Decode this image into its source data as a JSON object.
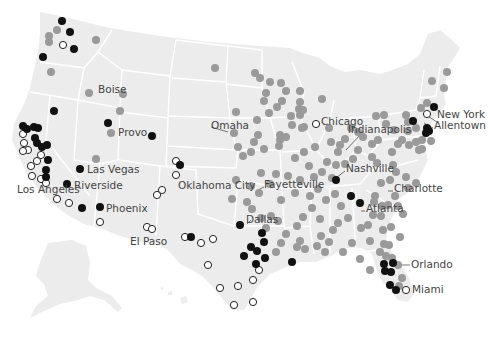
{
  "map": {
    "region": "United States (contiguous, with Alaska inset)",
    "legend_colors": {
      "gray": "#9a9a9a",
      "black": "#111111",
      "open": "#ffffff"
    }
  },
  "city_labels": [
    {
      "name": "Boise",
      "x": 98,
      "y": 93,
      "anchor": "start"
    },
    {
      "name": "Provo",
      "x": 118,
      "y": 136,
      "anchor": "start"
    },
    {
      "name": "Las Vegas",
      "x": 87,
      "y": 173,
      "anchor": "start"
    },
    {
      "name": "Riverside",
      "x": 74,
      "y": 189,
      "anchor": "start"
    },
    {
      "name": "Los Angeles",
      "x": 17,
      "y": 193,
      "anchor": "start"
    },
    {
      "name": "Phoenix",
      "x": 106,
      "y": 212,
      "anchor": "start"
    },
    {
      "name": "El Paso",
      "x": 130,
      "y": 245,
      "anchor": "start"
    },
    {
      "name": "Oklahoma City",
      "x": 178,
      "y": 189,
      "anchor": "start"
    },
    {
      "name": "Dallas",
      "x": 246,
      "y": 223,
      "anchor": "start"
    },
    {
      "name": "Omaha",
      "x": 211,
      "y": 129,
      "anchor": "start"
    },
    {
      "name": "Chicago",
      "x": 321,
      "y": 125,
      "anchor": "start"
    },
    {
      "name": "Indianapolis",
      "x": 348,
      "y": 133,
      "anchor": "start"
    },
    {
      "name": "Fayetteville",
      "x": 264,
      "y": 188,
      "anchor": "start"
    },
    {
      "name": "Nashville",
      "x": 346,
      "y": 172,
      "anchor": "start"
    },
    {
      "name": "Charlotte",
      "x": 394,
      "y": 192,
      "anchor": "start"
    },
    {
      "name": "Atlanta",
      "x": 366,
      "y": 212,
      "anchor": "start"
    },
    {
      "name": "New York",
      "x": 437,
      "y": 118,
      "anchor": "start"
    },
    {
      "name": "Allentown",
      "x": 434,
      "y": 129,
      "anchor": "start"
    },
    {
      "name": "Orlando",
      "x": 411,
      "y": 268,
      "anchor": "start"
    },
    {
      "name": "Miami",
      "x": 412,
      "y": 293,
      "anchor": "start"
    }
  ],
  "dots": {
    "black": [
      [
        62,
        21
      ],
      [
        70,
        32
      ],
      [
        74,
        49
      ],
      [
        43,
        57
      ],
      [
        54,
        111
      ],
      [
        23,
        126
      ],
      [
        27,
        129
      ],
      [
        34,
        127
      ],
      [
        38,
        128
      ],
      [
        35,
        138
      ],
      [
        37,
        143
      ],
      [
        42,
        147
      ],
      [
        47,
        145
      ],
      [
        48,
        160
      ],
      [
        46,
        170
      ],
      [
        80,
        169
      ],
      [
        67,
        184
      ],
      [
        46,
        177
      ],
      [
        82,
        208
      ],
      [
        100,
        207
      ],
      [
        108,
        123
      ],
      [
        152,
        136
      ],
      [
        180,
        165
      ],
      [
        191,
        237
      ],
      [
        240,
        225
      ],
      [
        262,
        233
      ],
      [
        257,
        251
      ],
      [
        264,
        242
      ],
      [
        251,
        247
      ],
      [
        265,
        258
      ],
      [
        244,
        256
      ],
      [
        256,
        264
      ],
      [
        292,
        262
      ],
      [
        351,
        196
      ],
      [
        360,
        203
      ],
      [
        434,
        107
      ],
      [
        413,
        121
      ],
      [
        427,
        128
      ],
      [
        429,
        131
      ],
      [
        426,
        133
      ],
      [
        384,
        264
      ],
      [
        393,
        263
      ],
      [
        385,
        271
      ],
      [
        391,
        272
      ],
      [
        390,
        285
      ],
      [
        396,
        290
      ],
      [
        336,
        180
      ]
    ],
    "open": [
      [
        63,
        45
      ],
      [
        23,
        134
      ],
      [
        24,
        143
      ],
      [
        28,
        150
      ],
      [
        23,
        151
      ],
      [
        37,
        161
      ],
      [
        41,
        155
      ],
      [
        31,
        166
      ],
      [
        32,
        176
      ],
      [
        41,
        179
      ],
      [
        46,
        183
      ],
      [
        57,
        199
      ],
      [
        69,
        203
      ],
      [
        100,
        222
      ],
      [
        147,
        227
      ],
      [
        152,
        229
      ],
      [
        162,
        190
      ],
      [
        157,
        195
      ],
      [
        176,
        175
      ],
      [
        176,
        161
      ],
      [
        185,
        237
      ],
      [
        201,
        243
      ],
      [
        213,
        239
      ],
      [
        208,
        265
      ],
      [
        238,
        286
      ],
      [
        220,
        288
      ],
      [
        234,
        305
      ],
      [
        259,
        270
      ],
      [
        253,
        280
      ],
      [
        253,
        302
      ],
      [
        316,
        124
      ],
      [
        427,
        114
      ],
      [
        406,
        290
      ]
    ],
    "gray": [
      [
        49,
        36
      ],
      [
        57,
        30
      ],
      [
        49,
        42
      ],
      [
        51,
        72
      ],
      [
        96,
        40
      ],
      [
        89,
        93
      ],
      [
        123,
        94
      ],
      [
        120,
        111
      ],
      [
        111,
        133
      ],
      [
        96,
        159
      ],
      [
        215,
        68
      ],
      [
        266,
        93
      ],
      [
        281,
        83
      ],
      [
        286,
        91
      ],
      [
        300,
        91
      ],
      [
        300,
        102
      ],
      [
        299,
        109
      ],
      [
        303,
        110
      ],
      [
        304,
        127
      ],
      [
        282,
        101
      ],
      [
        277,
        107
      ],
      [
        300,
        115
      ],
      [
        322,
        99
      ],
      [
        302,
        128
      ],
      [
        269,
        113
      ],
      [
        291,
        116
      ],
      [
        292,
        125
      ],
      [
        280,
        135
      ],
      [
        280,
        140
      ],
      [
        286,
        137
      ],
      [
        279,
        146
      ],
      [
        264,
        149
      ],
      [
        295,
        158
      ],
      [
        261,
        173
      ],
      [
        276,
        174
      ],
      [
        288,
        176
      ],
      [
        270,
        184
      ],
      [
        304,
        152
      ],
      [
        315,
        147
      ],
      [
        329,
        128
      ],
      [
        331,
        142
      ],
      [
        338,
        152
      ],
      [
        309,
        166
      ],
      [
        314,
        177
      ],
      [
        318,
        189
      ],
      [
        310,
        196
      ],
      [
        312,
        208
      ],
      [
        320,
        219
      ],
      [
        341,
        206
      ],
      [
        338,
        223
      ],
      [
        333,
        230
      ],
      [
        329,
        242
      ],
      [
        325,
        252
      ],
      [
        343,
        252
      ],
      [
        352,
        243
      ],
      [
        361,
        228
      ],
      [
        348,
        218
      ],
      [
        368,
        225
      ],
      [
        370,
        241
      ],
      [
        360,
        259
      ],
      [
        370,
        270
      ],
      [
        380,
        252
      ],
      [
        384,
        244
      ],
      [
        383,
        230
      ],
      [
        373,
        215
      ],
      [
        388,
        205
      ],
      [
        395,
        196
      ],
      [
        408,
        188
      ],
      [
        416,
        183
      ],
      [
        406,
        177
      ],
      [
        396,
        172
      ],
      [
        393,
        165
      ],
      [
        392,
        152
      ],
      [
        398,
        144
      ],
      [
        402,
        140
      ],
      [
        409,
        145
      ],
      [
        416,
        142
      ],
      [
        419,
        150
      ],
      [
        422,
        140
      ],
      [
        416,
        128
      ],
      [
        408,
        131
      ],
      [
        408,
        122
      ],
      [
        406,
        115
      ],
      [
        421,
        108
      ],
      [
        427,
        103
      ],
      [
        432,
        81
      ],
      [
        447,
        72
      ],
      [
        444,
        88
      ],
      [
        431,
        141
      ],
      [
        422,
        149
      ],
      [
        376,
        116
      ],
      [
        384,
        115
      ],
      [
        386,
        124
      ],
      [
        394,
        130
      ],
      [
        378,
        140
      ],
      [
        372,
        144
      ],
      [
        372,
        157
      ],
      [
        377,
        163
      ],
      [
        390,
        180
      ],
      [
        381,
        183
      ],
      [
        375,
        196
      ],
      [
        374,
        202
      ],
      [
        382,
        206
      ],
      [
        398,
        206
      ],
      [
        403,
        214
      ],
      [
        381,
        216
      ],
      [
        391,
        227
      ],
      [
        400,
        237
      ],
      [
        389,
        245
      ],
      [
        386,
        256
      ],
      [
        392,
        258
      ],
      [
        398,
        265
      ],
      [
        402,
        278
      ],
      [
        399,
        286
      ],
      [
        345,
        164
      ],
      [
        353,
        159
      ],
      [
        358,
        150
      ],
      [
        363,
        137
      ],
      [
        358,
        132
      ],
      [
        351,
        128
      ],
      [
        345,
        139
      ],
      [
        340,
        145
      ],
      [
        336,
        165
      ],
      [
        327,
        162
      ],
      [
        322,
        172
      ],
      [
        332,
        178
      ],
      [
        335,
        194
      ],
      [
        326,
        200
      ],
      [
        303,
        217
      ],
      [
        297,
        226
      ],
      [
        286,
        234
      ],
      [
        281,
        243
      ],
      [
        276,
        252
      ],
      [
        297,
        247
      ],
      [
        305,
        249
      ],
      [
        300,
        241
      ],
      [
        271,
        216
      ],
      [
        278,
        221
      ],
      [
        317,
        246
      ],
      [
        321,
        236
      ],
      [
        236,
        180
      ],
      [
        251,
        186
      ],
      [
        247,
        202
      ],
      [
        259,
        193
      ],
      [
        252,
        209
      ],
      [
        232,
        199
      ],
      [
        251,
        152
      ],
      [
        243,
        156
      ],
      [
        254,
        142
      ],
      [
        258,
        135
      ],
      [
        234,
        133
      ],
      [
        236,
        112
      ],
      [
        257,
        120
      ],
      [
        238,
        147
      ],
      [
        270,
        82
      ],
      [
        255,
        73
      ],
      [
        260,
        78
      ],
      [
        264,
        101
      ],
      [
        300,
        180
      ],
      [
        295,
        193
      ],
      [
        281,
        200
      ],
      [
        266,
        228
      ],
      [
        261,
        218
      ]
    ]
  },
  "label_leaders": [
    {
      "from": [
        211,
        127
      ],
      "to": [
        228,
        132
      ]
    },
    {
      "from": [
        361,
        134
      ],
      "to": [
        346,
        150
      ]
    },
    {
      "from": [
        264,
        187
      ],
      "to": [
        258,
        190
      ]
    },
    {
      "from": [
        345,
        171
      ],
      "to": [
        332,
        181
      ]
    },
    {
      "from": [
        393,
        191
      ],
      "to": [
        388,
        191
      ]
    },
    {
      "from": [
        365,
        211
      ],
      "to": [
        361,
        211
      ]
    },
    {
      "from": [
        437,
        122
      ],
      "to": [
        426,
        115
      ]
    },
    {
      "from": [
        433,
        128
      ],
      "to": [
        424,
        123
      ]
    },
    {
      "from": [
        410,
        265
      ],
      "to": [
        397,
        265
      ]
    },
    {
      "from": [
        251,
        220
      ],
      "to": [
        247,
        224
      ]
    }
  ]
}
